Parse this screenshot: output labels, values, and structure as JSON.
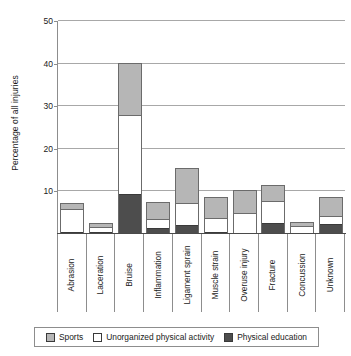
{
  "chart_data": {
    "type": "bar",
    "stacked": true,
    "title": "",
    "xlabel": "",
    "ylabel": "Percentage of all injuries",
    "ylim": [
      0,
      50
    ],
    "yticks": [
      10,
      20,
      30,
      40,
      50
    ],
    "grid": true,
    "legend_position": "bottom",
    "categories": [
      "Abrasion",
      "Laceration",
      "Bruise",
      "Inflammation",
      "Ligament sprain",
      "Muscle strain",
      "Overuse injury",
      "Fracture",
      "Concussion",
      "Unknown"
    ],
    "series": [
      {
        "name": "Physical education",
        "color": "#4d4d4d",
        "values": [
          0.4,
          0.4,
          9.4,
          1.4,
          2.2,
          0.4,
          0.3,
          2.5,
          0.3,
          2.4
        ]
      },
      {
        "name": "Unorganized physical activity",
        "color": "#ffffff",
        "values": [
          5.5,
          1.3,
          18.6,
          2.2,
          5.0,
          3.3,
          4.6,
          5.3,
          1.6,
          1.9
        ]
      },
      {
        "name": "Sports",
        "color": "#b6b6b6",
        "values": [
          1.1,
          0.6,
          12.0,
          3.6,
          8.0,
          4.7,
          5.1,
          3.4,
          0.7,
          4.1
        ]
      }
    ],
    "totals": [
      7.0,
      2.3,
      40.0,
      7.2,
      15.2,
      8.4,
      10.0,
      11.2,
      2.6,
      8.4
    ]
  },
  "legend": {
    "items": [
      {
        "label": "Sports",
        "swatch": "sports-swatch"
      },
      {
        "label": "Unorganized physical activity",
        "swatch": "unorganized-swatch"
      },
      {
        "label": "Physical education",
        "swatch": "physical-education-swatch"
      }
    ]
  },
  "axis": {
    "y_title": "Percentage of all injuries",
    "y_tick_labels": [
      "50",
      "40",
      "30",
      "20",
      "10"
    ]
  }
}
